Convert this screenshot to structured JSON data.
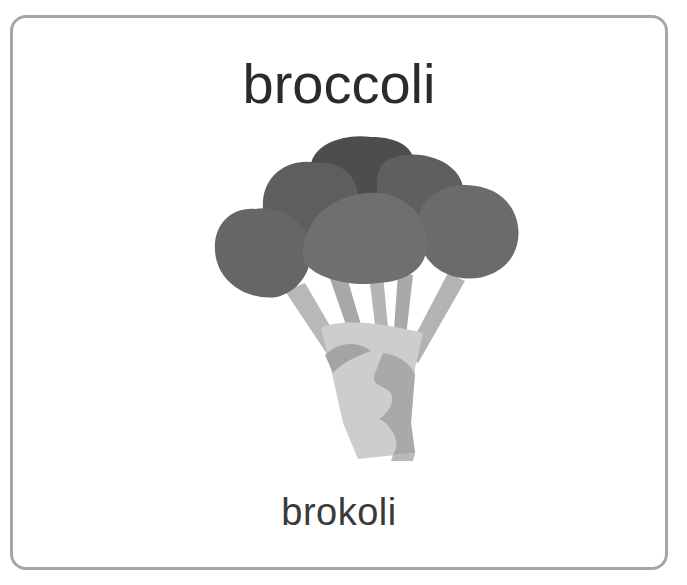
{
  "card": {
    "title": "broccoli",
    "subtitle": "brokoli",
    "image": {
      "icon": "broccoli-icon",
      "subject": "broccoli"
    }
  },
  "colors": {
    "border": "#a6a6a6",
    "title_text": "#2b2b2b",
    "subtitle_text": "#3a3a3a",
    "florets_dark": "#4f4f4f",
    "florets_mid": "#6a6a6a",
    "florets_light": "#7a7a7a",
    "stem_light": "#cfcfcf",
    "stem_mid": "#b3b3b3",
    "stem_dark": "#9c9c9c"
  }
}
